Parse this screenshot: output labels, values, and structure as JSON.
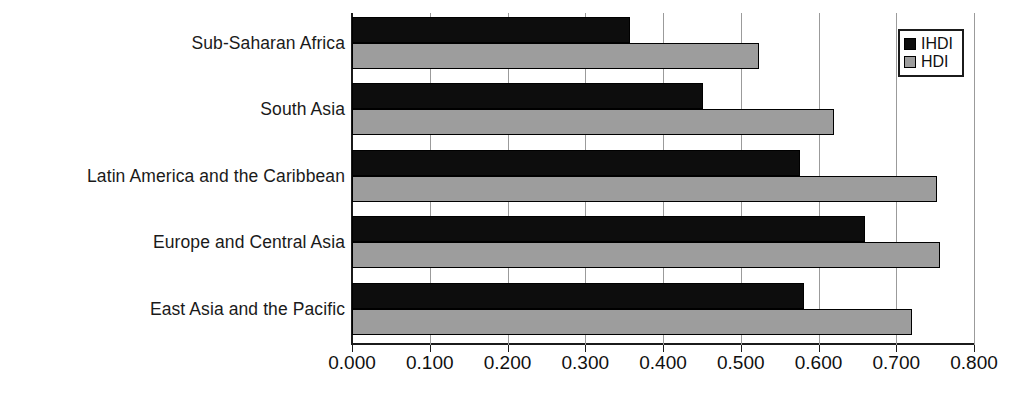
{
  "chart_data": {
    "type": "bar",
    "orientation": "horizontal",
    "title": "",
    "xlabel": "",
    "ylabel": "",
    "xlim": [
      0.0,
      0.8
    ],
    "xticks": [
      "0.000",
      "0.100",
      "0.200",
      "0.300",
      "0.400",
      "0.500",
      "0.600",
      "0.700",
      "0.800"
    ],
    "xtick_values": [
      0.0,
      0.1,
      0.2,
      0.3,
      0.4,
      0.5,
      0.6,
      0.7,
      0.8
    ],
    "grid": true,
    "legend_position": "top-right",
    "categories": [
      "Sub-Saharan Africa",
      "South Asia",
      "Latin America and the Caribbean",
      "Europe and Central Asia",
      "East Asia and the Pacific"
    ],
    "series": [
      {
        "name": "IHDI",
        "color": "#0d0d0d",
        "values": [
          0.357,
          0.451,
          0.576,
          0.66,
          0.581
        ]
      },
      {
        "name": "HDI",
        "color": "#9d9d9d",
        "values": [
          0.524,
          0.62,
          0.752,
          0.756,
          0.72
        ]
      }
    ]
  },
  "legend": {
    "items": [
      {
        "label": "IHDI",
        "swatch": "ihdi"
      },
      {
        "label": "HDI",
        "swatch": "hdi"
      }
    ]
  },
  "colors": {
    "ihdi": "#0d0d0d",
    "hdi": "#9d9d9d",
    "axis": "#1b1b1b",
    "grid": "#9b9b9b",
    "background": "#ffffff"
  }
}
